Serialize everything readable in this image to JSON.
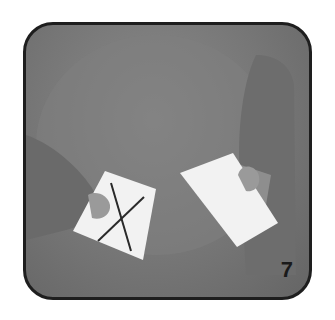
{
  "figure": {
    "step_number": "7",
    "frame_border_color": "#1e1e1e",
    "background_color": "#777777",
    "card_color": "#f2f2f2"
  }
}
